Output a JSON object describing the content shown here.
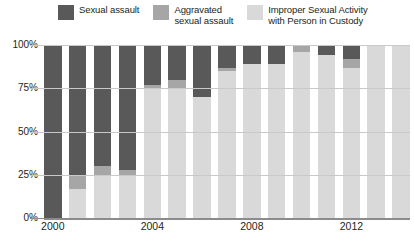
{
  "legend": {
    "items": [
      {
        "label": "Sexual assault",
        "color": "#595959",
        "key": "sexual_assault"
      },
      {
        "label": "Aggravated\nsexual assault",
        "color": "#a6a6a6",
        "key": "aggravated_sexual_assault"
      },
      {
        "label": "Improper Sexual Activity\nwith Person in Custody",
        "color": "#d9d9d9",
        "key": "improper_sexual_activity"
      }
    ]
  },
  "axis": {
    "y_ticks": [
      "0%",
      "25%",
      "50%",
      "75%",
      "100%"
    ],
    "y_tick_values": [
      0,
      25,
      50,
      75,
      100
    ],
    "x_ticks_shown": [
      "2000",
      "2004",
      "2008",
      "2012"
    ]
  },
  "colors": {
    "sexual_assault": "#595959",
    "aggravated_sexual_assault": "#a6a6a6",
    "improper_sexual_activity": "#d9d9d9",
    "gridline": "#c9c9c9",
    "axis": "#8c8c8c",
    "text": "#231f20",
    "background": "#ffffff"
  },
  "chart_data": {
    "type": "bar",
    "subtype": "stacked-100-percent",
    "title": "",
    "xlabel": "",
    "ylabel": "",
    "ylim": [
      0,
      100
    ],
    "grid": true,
    "legend_position": "top",
    "categories": [
      "2000",
      "2001",
      "2002",
      "2003",
      "2004",
      "2005",
      "2006",
      "2007",
      "2008",
      "2009",
      "2010",
      "2011",
      "2012",
      "2013",
      "2014"
    ],
    "tick_labels_visible": [
      "2000",
      "",
      "",
      "",
      "2004",
      "",
      "",
      "",
      "2008",
      "",
      "",
      "",
      "2012",
      "",
      ""
    ],
    "series": [
      {
        "name": "Sexual assault",
        "color": "#595959",
        "values": [
          100,
          75,
          70,
          72,
          23,
          20,
          30,
          13,
          11,
          11,
          0,
          6,
          8,
          0,
          0
        ]
      },
      {
        "name": "Aggravated sexual assault",
        "color": "#a6a6a6",
        "values": [
          0,
          8,
          5,
          3,
          2,
          5,
          0,
          2,
          0,
          0,
          4,
          0,
          5,
          0,
          0
        ]
      },
      {
        "name": "Improper Sexual Activity with Person in Custody",
        "color": "#d9d9d9",
        "values": [
          0,
          17,
          25,
          25,
          75,
          75,
          70,
          85,
          89,
          89,
          96,
          94,
          87,
          100,
          100
        ]
      }
    ]
  }
}
